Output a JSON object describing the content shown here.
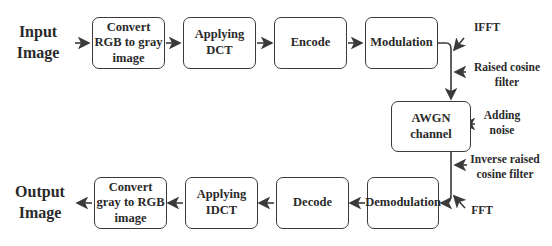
{
  "diagram": {
    "input_label": "Input\nImage",
    "output_label": "Output\nImage",
    "top_row": [
      {
        "id": "convert-rgb-gray",
        "label": "Convert RGB to gray image"
      },
      {
        "id": "applying-dct",
        "label": "Applying DCT"
      },
      {
        "id": "encode",
        "label": "Encode"
      },
      {
        "id": "modulation",
        "label": "Modulation"
      }
    ],
    "channel": {
      "id": "awgn-channel",
      "label": "AWGN channel"
    },
    "bottom_row": [
      {
        "id": "demodulation",
        "label": "Demodulation"
      },
      {
        "id": "decode",
        "label": "Decode"
      },
      {
        "id": "applying-idct",
        "label": "Applying IDCT"
      },
      {
        "id": "convert-gray-rgb",
        "label": "Convert gray to RGB image"
      }
    ],
    "annotations": {
      "ifft": "IFFT",
      "raised_cosine": "Raised cosine filter",
      "adding_noise": "Adding noise",
      "inverse_raised_cosine": "Inverse raised cosine filter",
      "fft": "FFT"
    },
    "colors": {
      "stroke": "#3a3a3a",
      "text": "#2a2a2a",
      "background": "#ffffff"
    }
  }
}
